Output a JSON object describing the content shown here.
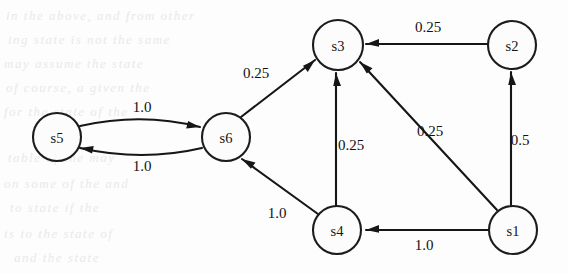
{
  "figure": {
    "kind": "state-transition-diagram",
    "title": "",
    "background_color": "#fdfdfd",
    "ink_color": "#161616",
    "node_fill": "#fcfcfc"
  },
  "nodes": [
    {
      "id": "s1",
      "label": "s1",
      "cx": 513,
      "cy": 230,
      "r": 24
    },
    {
      "id": "s2",
      "label": "s2",
      "cx": 512,
      "cy": 45,
      "r": 24
    },
    {
      "id": "s3",
      "label": "s3",
      "cx": 338,
      "cy": 45,
      "r": 25
    },
    {
      "id": "s4",
      "label": "s4",
      "cx": 337,
      "cy": 230,
      "r": 24
    },
    {
      "id": "s5",
      "label": "s5",
      "cx": 57,
      "cy": 137,
      "r": 24
    },
    {
      "id": "s6",
      "label": "s6",
      "cx": 226,
      "cy": 137,
      "r": 24
    }
  ],
  "edges": [
    {
      "id": "s2-s3",
      "from": "s2",
      "to": "s3",
      "label": "0.25",
      "label_x": 428,
      "label_y": 27,
      "shape": "straight",
      "path": "M 488 44 L 366 44",
      "arrow": {
        "x": 366,
        "y": 44,
        "angle": 180
      }
    },
    {
      "id": "s1-s2",
      "from": "s1",
      "to": "s2",
      "label": "0.5",
      "label_x": 520,
      "label_y": 140,
      "shape": "straight",
      "path": "M 511 206 L 511 72",
      "arrow": {
        "x": 511,
        "y": 72,
        "angle": -90
      }
    },
    {
      "id": "s1-s3",
      "from": "s1",
      "to": "s3",
      "label": "0.25",
      "label_x": 430,
      "label_y": 131,
      "shape": "straight",
      "path": "M 497 210 L 360 62",
      "arrow": {
        "x": 360,
        "y": 62,
        "angle": -132.8
      }
    },
    {
      "id": "s1-s4",
      "from": "s1",
      "to": "s4",
      "label": "1.0",
      "label_x": 424,
      "label_y": 245,
      "shape": "straight",
      "path": "M 489 230 L 366 230",
      "arrow": {
        "x": 366,
        "y": 230,
        "angle": 180
      }
    },
    {
      "id": "s4-s3",
      "from": "s4",
      "to": "s3",
      "label": "0.25",
      "label_x": 351,
      "label_y": 145,
      "shape": "straight",
      "path": "M 336 206 L 336 73",
      "arrow": {
        "x": 336,
        "y": 73,
        "angle": -90
      }
    },
    {
      "id": "s4-s6",
      "from": "s4",
      "to": "s6",
      "label": "1.0",
      "label_x": 277,
      "label_y": 213,
      "shape": "straight",
      "path": "M 318 214 L 242 159",
      "arrow": {
        "x": 242,
        "y": 159,
        "angle": -144.1
      }
    },
    {
      "id": "s6-s3",
      "from": "s6",
      "to": "s3",
      "label": "0.25",
      "label_x": 256,
      "label_y": 73,
      "shape": "straight",
      "path": "M 241 117 L 315 60",
      "arrow": {
        "x": 315,
        "y": 60,
        "angle": -37.6
      }
    },
    {
      "id": "s5-s6",
      "from": "s5",
      "to": "s6",
      "label": "1.0",
      "label_x": 142,
      "label_y": 107,
      "shape": "curved-upper",
      "path": "M 80 126 Q 142 112 200 127",
      "arrow": {
        "x": 200,
        "y": 127,
        "angle": 14.6
      }
    },
    {
      "id": "s6-s5",
      "from": "s6",
      "to": "s5",
      "label": "1.0",
      "label_x": 142,
      "label_y": 166,
      "shape": "curved-lower",
      "path": "M 202 148 Q 142 162 80 148",
      "arrow": {
        "x": 80,
        "y": 148,
        "angle": 192.7
      }
    }
  ],
  "ghost_text": {
    "note": "faint bleed-through text from reverse side of scanned page",
    "color": "#e9e9ea",
    "lines": [
      {
        "text": "in the above, and from other",
        "x": 6,
        "y": 8,
        "size": 13
      },
      {
        "text": "ing state is not the same",
        "x": 8,
        "y": 32,
        "size": 13
      },
      {
        "text": "may assume the state",
        "x": 4,
        "y": 56,
        "size": 13
      },
      {
        "text": "of course, a given the",
        "x": 6,
        "y": 80,
        "size": 13
      },
      {
        "text": "for the state of the",
        "x": 4,
        "y": 104,
        "size": 13
      },
      {
        "text": "table of the may",
        "x": 8,
        "y": 150,
        "size": 13
      },
      {
        "text": "on some of the and",
        "x": 4,
        "y": 176,
        "size": 13
      },
      {
        "text": "to state if the",
        "x": 10,
        "y": 200,
        "size": 13
      },
      {
        "text": "is to the state of",
        "x": 4,
        "y": 226,
        "size": 13
      },
      {
        "text": "and the state",
        "x": 14,
        "y": 250,
        "size": 13
      }
    ]
  }
}
